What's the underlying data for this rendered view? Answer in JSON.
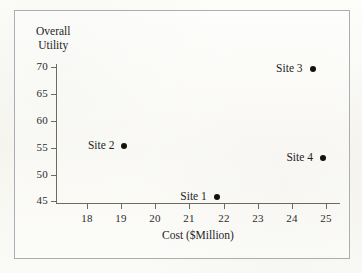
{
  "chart_data": {
    "type": "scatter",
    "title": "",
    "xlabel": "Cost ($Million)",
    "ylabel": "Overall Utility",
    "ylabel_line1": "Overall",
    "ylabel_line2": "Utility",
    "xlim": [
      17.1,
      25.4
    ],
    "ylim": [
      44.7,
      70.6
    ],
    "xticks": [
      18,
      19,
      20,
      21,
      22,
      23,
      24,
      25
    ],
    "yticks": [
      45,
      50,
      55,
      60,
      65,
      70
    ],
    "xtick_labels": [
      "18",
      "19",
      "20",
      "21",
      "22",
      "23",
      "24",
      "25"
    ],
    "ytick_labels": [
      "45",
      "50",
      "55",
      "60",
      "65",
      "70"
    ],
    "grid": false,
    "legend": "none",
    "marker": "filled-circle",
    "marker_color": "#14120f",
    "axis_color": "#6d6a60",
    "points": [
      {
        "label": "Site 1",
        "x": 21.8,
        "y": 45.8,
        "label_pos": "left"
      },
      {
        "label": "Site 2",
        "x": 19.1,
        "y": 55.4,
        "label_pos": "left"
      },
      {
        "label": "Site 3",
        "x": 24.6,
        "y": 69.6,
        "label_pos": "left"
      },
      {
        "label": "Site 4",
        "x": 24.9,
        "y": 53.0,
        "label_pos": "left"
      }
    ]
  }
}
